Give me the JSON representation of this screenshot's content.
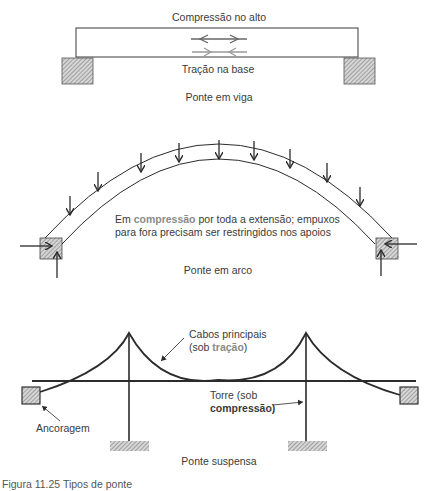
{
  "beam": {
    "top_label": "Compressão no alto",
    "bottom_label": "Tração na base",
    "title": "Ponte em viga"
  },
  "arch": {
    "note_line1_pre": "Em ",
    "note_line1_accent": "compressão",
    "note_line1_post": " por toda a extensão; empuxos",
    "note_line2": "para fora precisam ser restringidos nos apoios",
    "title": "Ponte em arco"
  },
  "suspension": {
    "cables_line1": "Cabos principais",
    "cables_line2_pre": "(sob ",
    "cables_line2_accent": "tração",
    "cables_line2_post": ")",
    "tower_line1": "Torre (sob",
    "tower_line2": "compressão)",
    "anchorage": "Ancoragem",
    "title": "Ponte suspensa"
  },
  "caption": "Figura 11.25 Tipos de ponte",
  "colors": {
    "line": "#2b2b2b",
    "accent": "#8a8a8a",
    "hatch": "#9a9a9a"
  }
}
